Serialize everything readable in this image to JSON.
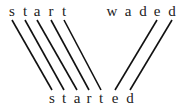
{
  "diagram": {
    "top_left_word": {
      "text": "start",
      "letters": [
        "s",
        "t",
        "a",
        "r",
        "t"
      ],
      "x": [
        12,
        25,
        37,
        51,
        64
      ],
      "y": 4
    },
    "top_right_word": {
      "text": "waded",
      "letters": [
        "w",
        "a",
        "d",
        "e",
        "d"
      ],
      "x": [
        112,
        128,
        143,
        157,
        172
      ],
      "y": 4
    },
    "bottom_word": {
      "text": "started",
      "letters": [
        "s",
        "t",
        "a",
        "r",
        "t",
        "e",
        "d"
      ],
      "x": [
        52,
        64,
        77,
        89,
        101,
        115,
        130
      ],
      "y": 91
    },
    "links": [
      {
        "from": [
          12,
          20
        ],
        "to": [
          52,
          90
        ]
      },
      {
        "from": [
          25,
          20
        ],
        "to": [
          64,
          90
        ]
      },
      {
        "from": [
          37,
          20
        ],
        "to": [
          77,
          90
        ]
      },
      {
        "from": [
          51,
          20
        ],
        "to": [
          89,
          90
        ]
      },
      {
        "from": [
          64,
          20
        ],
        "to": [
          101,
          90
        ]
      },
      {
        "from": [
          157,
          20
        ],
        "to": [
          115,
          90
        ]
      },
      {
        "from": [
          172,
          20
        ],
        "to": [
          130,
          90
        ]
      }
    ],
    "line_color": "#111111"
  }
}
